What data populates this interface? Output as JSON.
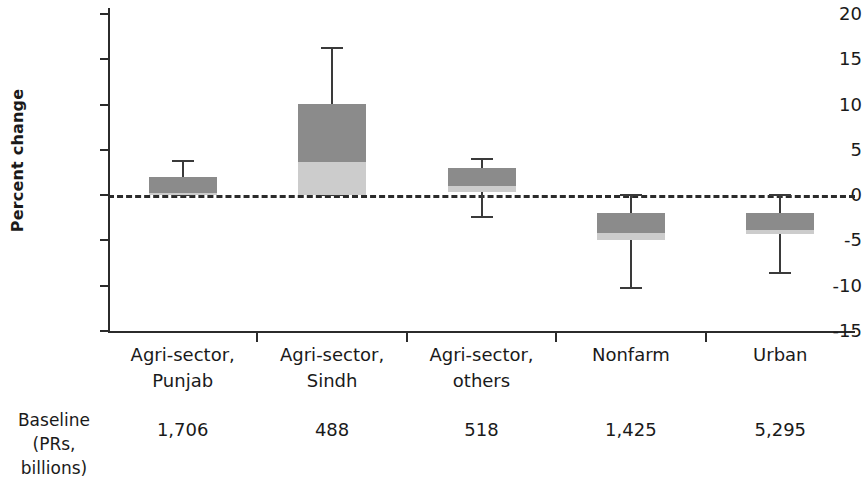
{
  "chart_data": {
    "type": "bar",
    "title": "",
    "xlabel": "",
    "ylabel": "Percent change",
    "ylim": [
      -15,
      20
    ],
    "yticks": [
      20,
      15,
      10,
      5,
      0,
      -5,
      -10,
      -15
    ],
    "ytick_labels": [
      "20",
      "15",
      "10",
      "5",
      "0",
      "-5",
      "-10",
      "-15"
    ],
    "grid": false,
    "legend": "none",
    "zero_reference_line": true,
    "categories": [
      "Agri-sector, Punjab",
      "Agri-sector, Sindh",
      "Agri-sector, others",
      "Nonfarm",
      "Urban"
    ],
    "category_lines": [
      [
        "Agri-sector,",
        "Punjab"
      ],
      [
        "Agri-sector,",
        "Sindh"
      ],
      [
        "Agri-sector,",
        "others"
      ],
      [
        "Nonfarm",
        ""
      ],
      [
        "Urban",
        ""
      ]
    ],
    "series": [
      {
        "name": "lower segment (light gray)",
        "color": "#cccccc",
        "values": [
          0.0,
          3.7,
          0.4,
          -5.0,
          -4.2
        ]
      },
      {
        "name": "upper segment (dark gray)",
        "color": "#8b8b8b",
        "values": [
          2.0,
          10.1,
          3.4,
          -2.0,
          -2.0
        ]
      }
    ],
    "bars": [
      {
        "category": "Agri-sector, Punjab",
        "top": 2.0,
        "split": 0.2,
        "bottom": 0.0,
        "whisker_high": 3.8,
        "whisker_low": 0.0,
        "baseline": "1,706"
      },
      {
        "category": "Agri-sector, Sindh",
        "top": 10.1,
        "split": 3.7,
        "bottom": 0.0,
        "whisker_high": 16.2,
        "whisker_low": 0.0,
        "baseline": "488"
      },
      {
        "category": "Agri-sector, others",
        "top": 3.0,
        "split": 1.0,
        "bottom": 0.4,
        "whisker_high": 4.0,
        "whisker_low": -2.4,
        "baseline": "518"
      },
      {
        "category": "Nonfarm",
        "top": -2.0,
        "split": -4.2,
        "bottom": -5.0,
        "whisker_high": 0.0,
        "whisker_low": -10.2,
        "baseline": "1,425"
      },
      {
        "category": "Urban",
        "top": -2.0,
        "split": -3.8,
        "bottom": -4.3,
        "whisker_high": 0.0,
        "whisker_low": -8.6,
        "baseline": "5,295"
      }
    ],
    "colors": {
      "dark_segment": "#8b8b8b",
      "light_segment": "#cccccc",
      "axis": "#2b2b2b",
      "background": "#ffffff"
    }
  },
  "baseline_row": {
    "label_line1": "Baseline",
    "label_line2": "(PRs, billions)",
    "values": [
      "1,706",
      "488",
      "518",
      "1,425",
      "5,295"
    ]
  }
}
